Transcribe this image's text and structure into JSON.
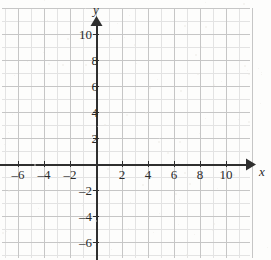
{
  "figure": {
    "kind": "cartesian-coordinate-plane",
    "width": 271,
    "height": 260,
    "background_color": "#fdfdfc"
  },
  "chart_data": {
    "type": "scatter",
    "title": "",
    "subtitle": "",
    "xlabel": "x",
    "ylabel": "y",
    "series": [],
    "x": [],
    "values": [],
    "annotations": [],
    "legend": {
      "entries": [],
      "position": "none"
    },
    "grid": {
      "visible": true,
      "minor_step": 1,
      "major_step": 2,
      "minor_color": "#e2e2e2",
      "major_color": "#c6c6c6"
    },
    "axes": {
      "color": "#2f2f2f",
      "origin_px": {
        "x": 96,
        "y": 164
      },
      "unit_px": 13,
      "arrowheads": [
        "x-positive",
        "y-positive"
      ]
    },
    "xlim": [
      -7.3,
      11.9
    ],
    "ylim": [
      -7.2,
      11.2
    ],
    "xticks": [
      -6,
      -4,
      -2,
      2,
      4,
      6,
      8,
      10
    ],
    "yticks": [
      10,
      8,
      6,
      4,
      2,
      -2,
      -4,
      -6
    ],
    "xtick_labels": [
      "–6",
      "–4",
      "–2",
      "2",
      "4",
      "6",
      "8",
      "10"
    ],
    "ytick_labels": [
      "10",
      "8",
      "6",
      "4",
      "2",
      "–2",
      "–4",
      "–6"
    ]
  },
  "x_axis": {
    "name": "x",
    "ticks": [
      {
        "value": -6,
        "label": "–6",
        "px": 18,
        "label_y": 168
      },
      {
        "value": -4,
        "label": "–4",
        "px": 44,
        "label_y": 168
      },
      {
        "value": -2,
        "label": "–2",
        "px": 70,
        "label_y": 168
      },
      {
        "value": 2,
        "label": "2",
        "px": 122,
        "label_y": 168
      },
      {
        "value": 4,
        "label": "4",
        "px": 148,
        "label_y": 168
      },
      {
        "value": 6,
        "label": "6",
        "px": 174,
        "label_y": 168
      },
      {
        "value": 8,
        "label": "8",
        "px": 200,
        "label_y": 168
      },
      {
        "value": 10,
        "label": "10",
        "px": 226,
        "label_y": 168
      }
    ]
  },
  "y_axis": {
    "name": "y",
    "ticks": [
      {
        "value": 10,
        "label": "10",
        "px": 34,
        "label_x": 76
      },
      {
        "value": 8,
        "label": "8",
        "px": 60,
        "label_x": 82
      },
      {
        "value": 6,
        "label": "6",
        "px": 86,
        "label_x": 82
      },
      {
        "value": 4,
        "label": "4",
        "px": 112,
        "label_x": 82
      },
      {
        "value": 2,
        "label": "2",
        "px": 138,
        "label_x": 82
      },
      {
        "value": -2,
        "label": "–2",
        "px": 190,
        "label_x": 76
      },
      {
        "value": -4,
        "label": "–4",
        "px": 216,
        "label_x": 76
      },
      {
        "value": -6,
        "label": "–6",
        "px": 242,
        "label_x": 76
      }
    ]
  },
  "axis_names": {
    "x_label": "x",
    "x_label_px": {
      "x": 259,
      "y": 165
    },
    "y_label": "y",
    "y_label_px": {
      "x": 93,
      "y": 3
    }
  }
}
